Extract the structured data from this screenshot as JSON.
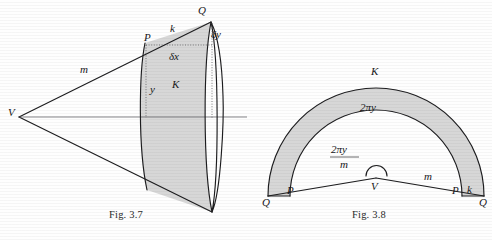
{
  "page": {
    "background_color": "#fefefe",
    "ink_color": "#1d1d1f",
    "shade_color": "#d7d7d7"
  },
  "figures": [
    {
      "id": "fig-3-7",
      "caption": "Fig. 3.7",
      "description": "Cone with apex V and a shaded frustum band K between circles through P and Q",
      "labels": {
        "apex": "V",
        "slant_m": "m",
        "slant_k": "k",
        "point_p": "P",
        "point_q": "Q",
        "band": "K",
        "radius_y": "y",
        "delta_x": "δx",
        "delta_y": "δy"
      }
    },
    {
      "id": "fig-3-8",
      "caption": "Fig. 3.8",
      "description": "Unrolled cone: circular sector annulus K between radii through P and Q",
      "labels": {
        "apex": "V",
        "band": "K",
        "arc_inner": "2πy",
        "angle_numerator": "2πy",
        "angle_denominator": "m",
        "slant_m": "m",
        "slant_k": "k",
        "point_p_left": "P",
        "point_p_right": "P",
        "point_q_left": "Q",
        "point_q_right": "Q"
      }
    }
  ]
}
